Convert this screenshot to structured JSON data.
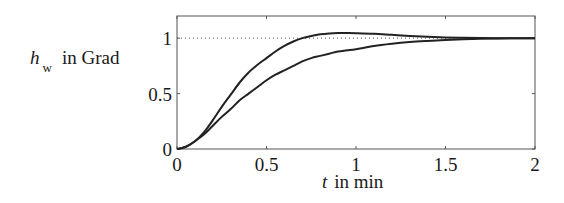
{
  "chart_data": {
    "type": "line",
    "title": "",
    "xlabel": "t in min",
    "ylabel": "h_w in Grad",
    "xlabel_parts": {
      "symbol": "t",
      "rest": "in min"
    },
    "ylabel_parts": {
      "symbol": "h",
      "subscript": "w",
      "rest": "in Grad"
    },
    "xlim": [
      0,
      2
    ],
    "ylim": [
      0,
      1.2
    ],
    "xticks": [
      0,
      0.5,
      1,
      1.5,
      2
    ],
    "xtick_labels": [
      "0",
      "0.5",
      "1",
      "1.5",
      "2"
    ],
    "yticks": [
      0,
      0.5,
      1
    ],
    "ytick_labels": [
      "0",
      "0.5",
      "1"
    ],
    "grid": false,
    "legend": null,
    "reference_line": {
      "y": 1,
      "style": "dotted"
    },
    "x": [
      0,
      0.05,
      0.1,
      0.15,
      0.2,
      0.25,
      0.3,
      0.35,
      0.4,
      0.45,
      0.5,
      0.55,
      0.6,
      0.65,
      0.7,
      0.75,
      0.8,
      0.85,
      0.9,
      0.95,
      1.0,
      1.1,
      1.2,
      1.3,
      1.4,
      1.5,
      1.6,
      1.7,
      1.8,
      1.9,
      2.0
    ],
    "series": [
      {
        "name": "curve-fast (overshoot)",
        "values": [
          0,
          0.02,
          0.07,
          0.15,
          0.26,
          0.38,
          0.49,
          0.6,
          0.69,
          0.76,
          0.82,
          0.88,
          0.93,
          0.97,
          1.0,
          1.02,
          1.035,
          1.043,
          1.046,
          1.046,
          1.045,
          1.04,
          1.03,
          1.02,
          1.012,
          1.006,
          1.003,
          1.001,
          1.0,
          1.0,
          1.0
        ]
      },
      {
        "name": "curve-slow (no overshoot)",
        "values": [
          0,
          0.02,
          0.07,
          0.13,
          0.21,
          0.29,
          0.36,
          0.44,
          0.5,
          0.56,
          0.62,
          0.67,
          0.71,
          0.75,
          0.79,
          0.82,
          0.84,
          0.86,
          0.88,
          0.89,
          0.9,
          0.93,
          0.95,
          0.965,
          0.975,
          0.983,
          0.99,
          0.995,
          0.998,
          0.999,
          1.0
        ]
      }
    ]
  }
}
